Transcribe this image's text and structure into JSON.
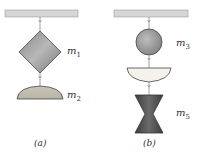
{
  "figure_a": {
    "caption": "(a)",
    "masses": [
      {
        "symbol": "m",
        "subscript": "1",
        "shape": "diamond"
      },
      {
        "symbol": "m",
        "subscript": "2",
        "shape": "dome"
      }
    ]
  },
  "figure_b": {
    "caption": "(b)",
    "masses": [
      {
        "symbol": "m",
        "subscript": "3",
        "shape": "circle"
      },
      {
        "symbol": "",
        "subscript": "",
        "shape": "bowl"
      },
      {
        "symbol": "m",
        "subscript": "5",
        "shape": "hourglass"
      }
    ]
  },
  "colors": {
    "ceiling": "#d4d6d8",
    "mass_gray": "#a8a8a8",
    "mass_dark": "#555555",
    "light_fill": "#f4f2ea",
    "string": "#888888"
  }
}
